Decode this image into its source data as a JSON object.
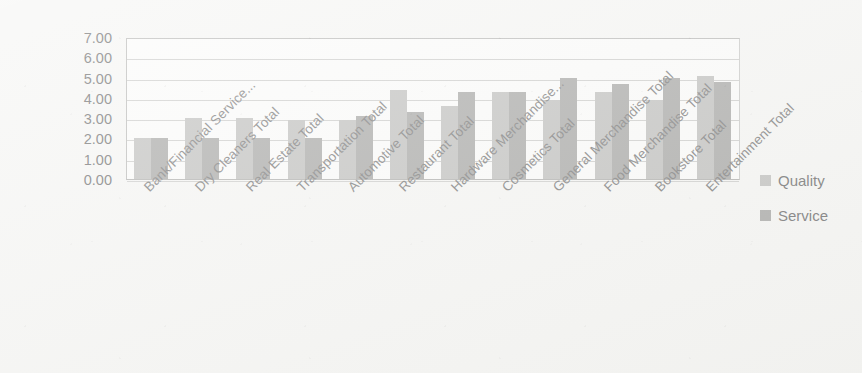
{
  "chart_data": {
    "type": "bar",
    "title": "",
    "subtitle": "",
    "xlabel": "",
    "ylabel": "",
    "ylim": [
      0,
      7
    ],
    "ytick_step": 1,
    "ytick_labels": [
      "7.00",
      "6.00",
      "5.00",
      "4.00",
      "3.00",
      "2.00",
      "1.00",
      "0.00"
    ],
    "ytick_values": [
      7,
      6,
      5,
      4,
      3,
      2,
      1,
      0
    ],
    "grid": true,
    "grid_axis": "y",
    "legend_position": "right",
    "categories": [
      "Bank/Financial Service...",
      "Dry Cleaners Total",
      "Real Estate Total",
      "Transportation Total",
      "Automotive Total",
      "Restaurant Total",
      "Hardware Merchandise...",
      "Cosmetics Total",
      "General Merchandise Total",
      "Food Merchandise Total",
      "Bookstore Total",
      "Entertainment Total"
    ],
    "series": [
      {
        "name": "Quality",
        "color": "#b2b2b0",
        "values": [
          2.0,
          3.0,
          3.0,
          2.9,
          2.9,
          4.4,
          3.6,
          4.3,
          3.9,
          4.3,
          3.9,
          5.1
        ]
      },
      {
        "name": "Service",
        "color": "#949492",
        "values": [
          2.0,
          2.0,
          2.0,
          2.0,
          3.1,
          3.3,
          4.3,
          4.3,
          5.0,
          4.7,
          5.0,
          4.8
        ]
      }
    ]
  },
  "legend": {
    "items": [
      {
        "label": "Quality",
        "swatch": "quality-swatch"
      },
      {
        "label": "Service",
        "swatch": "service-swatch"
      }
    ]
  },
  "colors": {
    "background": "#f4f4f2",
    "plot_background": "#fbfbfa",
    "gridline": "#c2c2c0",
    "axis": "#a9a9a7",
    "quality": "#b2b2b0",
    "service": "#949492",
    "tick_text": "#4b4b4b",
    "category_text": "#585858"
  }
}
